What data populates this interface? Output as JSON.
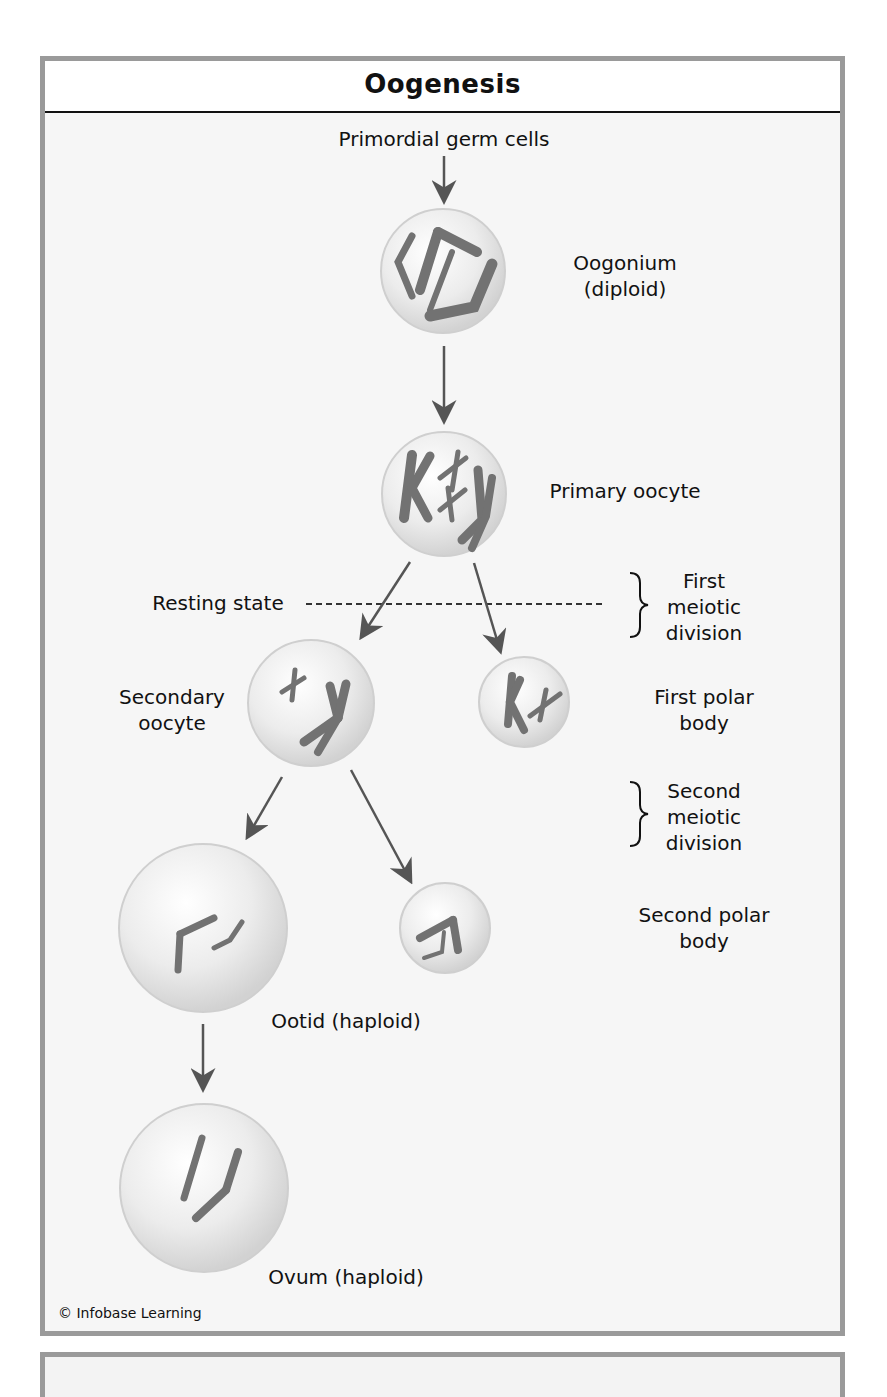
{
  "figure": {
    "title": "Oogenesis",
    "credit": "© Infobase Learning"
  },
  "labels": {
    "primordial": "Primordial germ cells",
    "oogonium_1": "Oogonium",
    "oogonium_2": "(diploid)",
    "primary_oocyte": "Primary oocyte",
    "resting_state": "Resting state",
    "first_div_1": "First",
    "first_div_2": "meiotic",
    "first_div_3": "division",
    "secondary_1": "Secondary",
    "secondary_2": "oocyte",
    "first_polar_1": "First polar",
    "first_polar_2": "body",
    "second_div_1": "Second",
    "second_div_2": "meiotic",
    "second_div_3": "division",
    "second_polar_1": "Second polar",
    "second_polar_2": "body",
    "ootid": "Ootid (haploid)",
    "ovum": "Ovum (haploid)"
  },
  "colors": {
    "frame_border": "#9a9a9a",
    "arrow": "#555555",
    "chromosome": "#707070",
    "cell_fill": "#ececec"
  }
}
